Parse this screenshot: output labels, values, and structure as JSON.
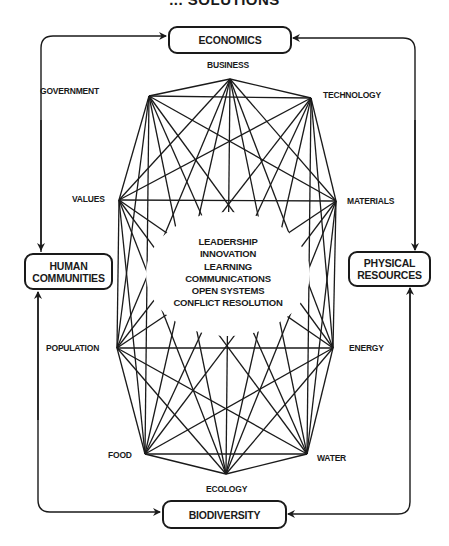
{
  "title": "... SOLUTIONS",
  "outer_boxes": {
    "top": "ECONOMICS",
    "left_line1": "HUMAN",
    "left_line2": "COMMUNITIES",
    "right_line1": "PHYSICAL",
    "right_line2": "RESOURCES",
    "bottom": "BIODIVERSITY"
  },
  "nodes": [
    {
      "id": "business",
      "label": "BUSINESS",
      "x": 230,
      "y": 79
    },
    {
      "id": "technology",
      "label": "TECHNOLOGY",
      "x": 311,
      "y": 98
    },
    {
      "id": "materials",
      "label": "MATERIALS",
      "x": 336,
      "y": 201
    },
    {
      "id": "energy",
      "label": "ENERGY",
      "x": 333,
      "y": 348
    },
    {
      "id": "water",
      "label": "WATER",
      "x": 307,
      "y": 454
    },
    {
      "id": "ecology",
      "label": "ECOLOGY",
      "x": 226,
      "y": 474
    },
    {
      "id": "food",
      "label": "FOOD",
      "x": 145,
      "y": 454
    },
    {
      "id": "population",
      "label": "POPULATION",
      "x": 117,
      "y": 348
    },
    {
      "id": "values",
      "label": "VALUES",
      "x": 119,
      "y": 200
    },
    {
      "id": "government",
      "label": "GOVERNMENT",
      "x": 149,
      "y": 96
    }
  ],
  "center_items": [
    "LEADERSHIP",
    "INNOVATION",
    "LEARNING",
    "COMMUNICATIONS",
    "OPEN SYSTEMS",
    "CONFLICT RESOLUTION"
  ],
  "colors": {
    "ink": "#1a1a1a",
    "background": "#ffffff"
  }
}
